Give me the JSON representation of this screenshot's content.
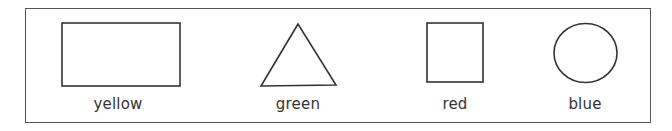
{
  "diagram": {
    "items": [
      {
        "shape": "rectangle",
        "label": "yellow"
      },
      {
        "shape": "triangle",
        "label": "green"
      },
      {
        "shape": "square",
        "label": "red"
      },
      {
        "shape": "circle",
        "label": "blue"
      }
    ],
    "stroke_color": "#333333",
    "frame_color": "#555555"
  }
}
